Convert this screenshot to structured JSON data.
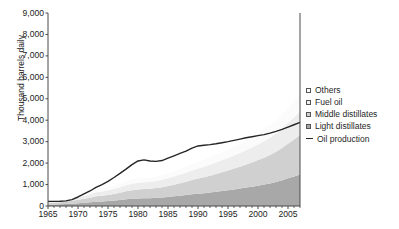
{
  "axes": {
    "ylabel": "Thousand barrels daily",
    "ytick_labels": [
      "9,000",
      "8,000",
      "7,000",
      "6,000",
      "5,000",
      "4,000",
      "3,000",
      "2,000",
      "1,000",
      "0"
    ],
    "xtick_labels": [
      "1965",
      "1970",
      "1975",
      "1980",
      "1985",
      "1990",
      "1995",
      "2000",
      "2005"
    ]
  },
  "legend": {
    "items": [
      {
        "label": "Others",
        "swatch": "#fbfbfb",
        "type": "area"
      },
      {
        "label": "Fuel oil",
        "swatch": "#ededed",
        "type": "area"
      },
      {
        "label": "Middle distillates",
        "swatch": "#d0d0d0",
        "type": "area"
      },
      {
        "label": "Light distillates",
        "swatch": "#a8a8a8",
        "type": "area"
      },
      {
        "label": "Oil production",
        "swatch": "#262626",
        "type": "line"
      }
    ]
  },
  "colors": {
    "others": "#fbfbfb",
    "fuel_oil": "#ededed",
    "middle_distillates": "#d0d0d0",
    "light_distillates": "#a8a8a8",
    "oil_production_line": "#262626",
    "axis": "#4a4a4a",
    "text": "#1f1f1f"
  },
  "chart_data": {
    "type": "area",
    "title": "",
    "xlabel": "",
    "ylabel": "Thousand barrels daily",
    "xlim": [
      1965,
      2007
    ],
    "ylim": [
      0,
      9000
    ],
    "ytick_values": [
      0,
      1000,
      2000,
      3000,
      4000,
      5000,
      6000,
      7000,
      8000,
      9000
    ],
    "xtick_values": [
      1965,
      1970,
      1975,
      1980,
      1985,
      1990,
      1995,
      2000,
      2005
    ],
    "grid": false,
    "legend_position": "right",
    "stacked": true,
    "x": [
      1965,
      1966,
      1967,
      1968,
      1969,
      1970,
      1971,
      1972,
      1973,
      1974,
      1975,
      1976,
      1977,
      1978,
      1979,
      1980,
      1981,
      1982,
      1983,
      1984,
      1985,
      1986,
      1987,
      1988,
      1989,
      1990,
      1991,
      1992,
      1993,
      1994,
      1995,
      1996,
      1997,
      1998,
      1999,
      2000,
      2001,
      2002,
      2003,
      2004,
      2005,
      2006,
      2007
    ],
    "series": [
      {
        "name": "Light distillates",
        "values": [
          60,
          70,
          80,
          95,
          110,
          130,
          150,
          170,
          200,
          215,
          230,
          255,
          280,
          310,
          335,
          350,
          360,
          365,
          380,
          400,
          420,
          450,
          480,
          510,
          545,
          575,
          600,
          630,
          665,
          700,
          735,
          775,
          815,
          860,
          900,
          950,
          1000,
          1055,
          1120,
          1200,
          1290,
          1380,
          1470
        ]
      },
      {
        "name": "Middle distillates",
        "values": [
          70,
          80,
          95,
          115,
          135,
          160,
          185,
          215,
          250,
          265,
          285,
          310,
          340,
          375,
          405,
          420,
          430,
          435,
          455,
          480,
          510,
          545,
          585,
          625,
          670,
          710,
          745,
          785,
          830,
          875,
          920,
          970,
          1020,
          1075,
          1130,
          1190,
          1255,
          1325,
          1405,
          1505,
          1615,
          1725,
          1840
        ]
      },
      {
        "name": "Fuel oil",
        "values": [
          55,
          65,
          75,
          90,
          105,
          125,
          145,
          165,
          190,
          200,
          215,
          235,
          255,
          280,
          300,
          310,
          315,
          318,
          330,
          345,
          360,
          380,
          400,
          420,
          445,
          465,
          485,
          505,
          530,
          555,
          580,
          605,
          635,
          665,
          695,
          730,
          765,
          805,
          850,
          905,
          965,
          1025,
          1085
        ]
      },
      {
        "name": "Others",
        "values": [
          30,
          35,
          42,
          50,
          60,
          72,
          85,
          100,
          118,
          125,
          135,
          148,
          162,
          178,
          192,
          198,
          202,
          205,
          213,
          223,
          235,
          250,
          265,
          282,
          300,
          315,
          330,
          345,
          363,
          382,
          400,
          420,
          442,
          465,
          488,
          515,
          542,
          572,
          608,
          650,
          695,
          740,
          785
        ]
      }
    ],
    "line_series": {
      "name": "Oil production",
      "values": [
        215,
        215,
        220,
        240,
        300,
        420,
        560,
        700,
        870,
        1000,
        1150,
        1330,
        1520,
        1720,
        1930,
        2100,
        2150,
        2100,
        2080,
        2120,
        2230,
        2340,
        2450,
        2560,
        2700,
        2800,
        2830,
        2860,
        2900,
        2950,
        3000,
        3060,
        3120,
        3180,
        3230,
        3280,
        3330,
        3400,
        3480,
        3570,
        3680,
        3790,
        3900
      ]
    }
  }
}
